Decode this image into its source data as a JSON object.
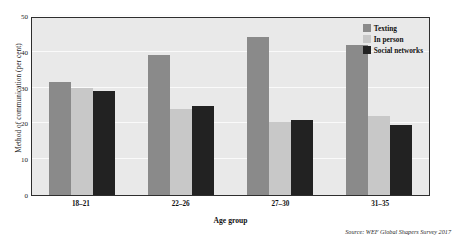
{
  "chart_data": {
    "type": "bar",
    "title": "",
    "subtitle": "",
    "xlabel": "Age group",
    "ylabel": "Method of communication (per cent)",
    "categories": [
      "18–21",
      "22–26",
      "27–30",
      "31–35"
    ],
    "series": [
      {
        "name": "Texting",
        "color": "#8a8a8a",
        "values": [
          31.5,
          39.0,
          44.0,
          42.0
        ]
      },
      {
        "name": "In person",
        "color": "#c8c8c8",
        "values": [
          30.0,
          24.0,
          20.5,
          22.0
        ]
      },
      {
        "name": "Social networks",
        "color": "#222222",
        "values": [
          29.0,
          25.0,
          21.0,
          19.5
        ]
      }
    ],
    "ylim": [
      0,
      50
    ],
    "yticks": [
      0,
      10,
      20,
      30,
      40,
      50
    ],
    "ytick_labels": [
      "0",
      "10",
      "20",
      "30",
      "40",
      "50"
    ],
    "grid": true,
    "grid_axis": "y",
    "legend_position": "top-right",
    "plot_background": "#e9e9e9",
    "grid_color": "#fafafa",
    "frame_color": "#2e2e2e",
    "source_note": "Source: WEF Global Shapers Survey 2017"
  }
}
